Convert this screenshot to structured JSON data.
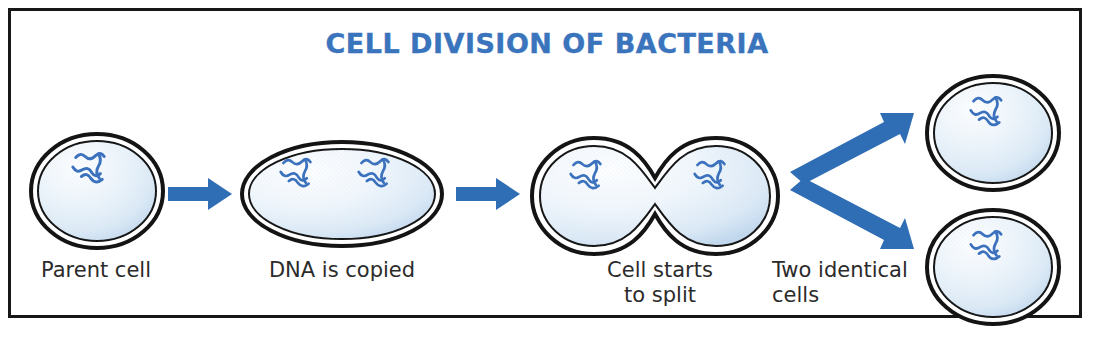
{
  "figure": {
    "title": "CELL DIVISION OF BACTERIA",
    "title_color": "#3a74bd",
    "frame_color": "#171717",
    "background": "#ffffff"
  },
  "palette": {
    "arrow_blue": "#2f6db4",
    "dna_blue": "#3c72bd",
    "cell_outline": "#141414",
    "cytoplasm_light": "#fbfdff",
    "cytoplasm_mid": "#e4eef8",
    "cytoplasm_deep": "#c6dcef",
    "label_text": "#2b2b2b"
  },
  "stages": [
    {
      "id": "parent-cell",
      "label": "Parent cell",
      "shape": "round-oval",
      "dna_strand_count": 1
    },
    {
      "id": "dna-copied-cell",
      "label": "DNA is copied",
      "shape": "elongated-oval",
      "dna_strand_count": 2
    },
    {
      "id": "splitting-cell",
      "label": "Cell starts\nto split",
      "shape": "dumbbell",
      "dna_strand_count": 2
    },
    {
      "id": "daughter-cells",
      "label": "Two identical\ncells",
      "shape": "two-circles",
      "dna_strand_count": 2
    }
  ],
  "arrows": [
    {
      "id": "arrow-1",
      "direction": "right",
      "from": "parent-cell",
      "to": "dna-copied-cell"
    },
    {
      "id": "arrow-2",
      "direction": "right",
      "from": "dna-copied-cell",
      "to": "splitting-cell"
    },
    {
      "id": "arrow-3",
      "direction": "up-right",
      "from": "splitting-cell",
      "to": "daughter-cell-top"
    },
    {
      "id": "arrow-4",
      "direction": "down-right",
      "from": "splitting-cell",
      "to": "daughter-cell-bottom"
    }
  ]
}
